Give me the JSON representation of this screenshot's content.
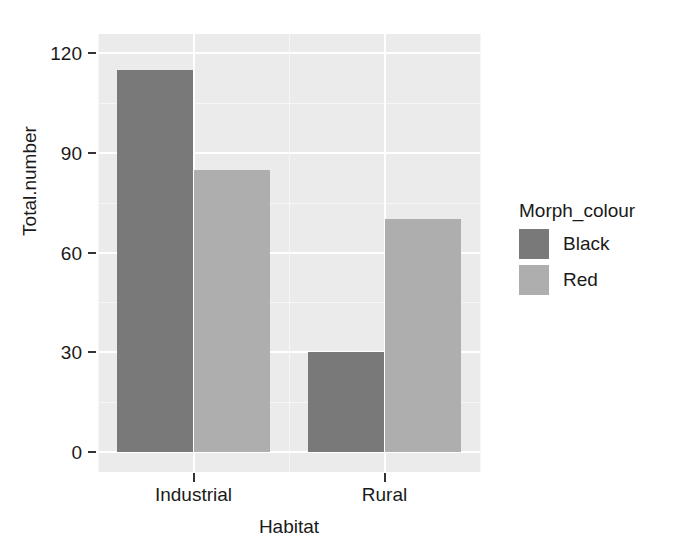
{
  "chart_data": {
    "type": "bar",
    "title": "",
    "subtitle": "",
    "xlabel": "Habitat",
    "ylabel": "Total.number",
    "categories": [
      "Industrial",
      "Rural"
    ],
    "series": [
      {
        "name": "Black",
        "values": [
          115,
          30
        ],
        "color": "#797979"
      },
      {
        "name": "Red",
        "values": [
          85,
          70
        ],
        "color": "#aeaeae"
      }
    ],
    "legend": {
      "title": "Morph_colour",
      "position": "right",
      "entries": [
        {
          "label": "Black",
          "color": "#797979"
        },
        {
          "label": "Red",
          "color": "#aeaeae"
        }
      ]
    },
    "yticks": [
      0,
      30,
      60,
      90,
      120
    ],
    "ytick_labels": [
      "0",
      "30",
      "60",
      "90",
      "120"
    ],
    "ylim": [
      0,
      125.8
    ],
    "y_minor_ticks": [
      15,
      45,
      75,
      105
    ],
    "grid": true,
    "grid_color": "#ffffff",
    "panel_background": "#ebebeb",
    "bar_position": "dodge",
    "style": "ggplot2-grey"
  },
  "axis": {
    "y_label": "Total.number",
    "x_label": "Habitat"
  }
}
